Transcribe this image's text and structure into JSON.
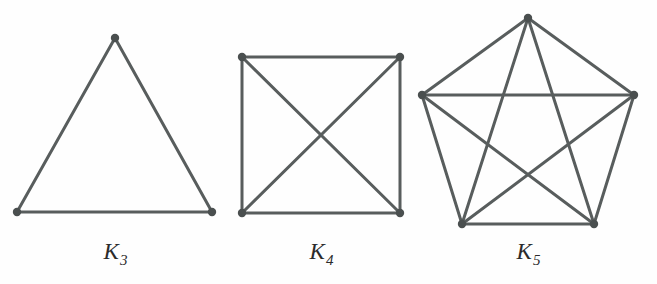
{
  "figure": {
    "background_color": "#fefefe",
    "edge_color": "#585d5d",
    "vertex_color": "#4a4f4f",
    "label_color": "#2b2b2b",
    "edge_width": 3,
    "vertex_radius": 4.2,
    "width": 657,
    "height": 284
  },
  "graphs": [
    {
      "id": "k3",
      "label_letter": "K",
      "label_subscript": "3",
      "label_full": "K3",
      "label_x": 115,
      "label_y": 240,
      "vertex_count": 3,
      "edge_count": 3,
      "vertices": [
        {
          "name": "apex",
          "x": 115,
          "y": 38
        },
        {
          "name": "bottom-left",
          "x": 17,
          "y": 212
        },
        {
          "name": "bottom-right",
          "x": 212,
          "y": 212
        }
      ],
      "edges": [
        [
          0,
          1
        ],
        [
          0,
          2
        ],
        [
          1,
          2
        ]
      ]
    },
    {
      "id": "k4",
      "label_letter": "K",
      "label_subscript": "4",
      "label_full": "K4",
      "label_x": 321,
      "label_y": 240,
      "vertex_count": 4,
      "edge_count": 6,
      "vertices": [
        {
          "name": "top-left",
          "x": 242,
          "y": 57
        },
        {
          "name": "top-right",
          "x": 400,
          "y": 57
        },
        {
          "name": "bottom-right",
          "x": 400,
          "y": 213
        },
        {
          "name": "bottom-left",
          "x": 242,
          "y": 213
        }
      ],
      "edges": [
        [
          0,
          1
        ],
        [
          1,
          2
        ],
        [
          2,
          3
        ],
        [
          3,
          0
        ],
        [
          0,
          2
        ],
        [
          1,
          3
        ]
      ]
    },
    {
      "id": "k5",
      "label_letter": "K",
      "label_subscript": "5",
      "label_full": "K5",
      "label_x": 528,
      "label_y": 240,
      "vertex_count": 5,
      "edge_count": 10,
      "vertices": [
        {
          "name": "top",
          "x": 528,
          "y": 18
        },
        {
          "name": "right",
          "x": 634,
          "y": 95
        },
        {
          "name": "bottom-right",
          "x": 594,
          "y": 224
        },
        {
          "name": "bottom-left",
          "x": 462,
          "y": 224
        },
        {
          "name": "left",
          "x": 422,
          "y": 95
        }
      ],
      "edges": [
        [
          0,
          1
        ],
        [
          1,
          2
        ],
        [
          2,
          3
        ],
        [
          3,
          4
        ],
        [
          4,
          0
        ],
        [
          0,
          2
        ],
        [
          0,
          3
        ],
        [
          1,
          3
        ],
        [
          1,
          4
        ],
        [
          2,
          4
        ]
      ]
    }
  ]
}
